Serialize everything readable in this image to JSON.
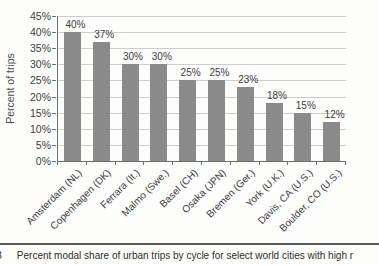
{
  "figure": {
    "caption_number": "3",
    "caption_text": "Percent modal share of urban trips by cycle for select world cities with high r"
  },
  "chart_data": {
    "type": "bar",
    "title": "",
    "xlabel": "",
    "ylabel": "Percent of trips",
    "ylim": [
      0,
      45
    ],
    "ytick_step": 5,
    "ytick_labels": [
      "0%",
      "5%",
      "10%",
      "15%",
      "20%",
      "25%",
      "30%",
      "35%",
      "40%",
      "45%"
    ],
    "grid": "horizontal",
    "legend": "none",
    "bar_color": "#8a8a8a",
    "categories": [
      "Amsterdam (NL)",
      "Copenhagen (DK)",
      "Ferrara (It.)",
      "Malmo (Swe.)",
      "Basel (CH)",
      "Osaka (JPN)",
      "Bremen (Ger.)",
      "York (U.K.)",
      "Davis, CA (U.S.)",
      "Boulder, CO (U.S.)"
    ],
    "values": [
      40,
      37,
      30,
      30,
      25,
      25,
      23,
      18,
      15,
      12
    ],
    "data_labels": [
      "40%",
      "37%",
      "30%",
      "30%",
      "25%",
      "25%",
      "23%",
      "18%",
      "15%",
      "12%"
    ]
  }
}
